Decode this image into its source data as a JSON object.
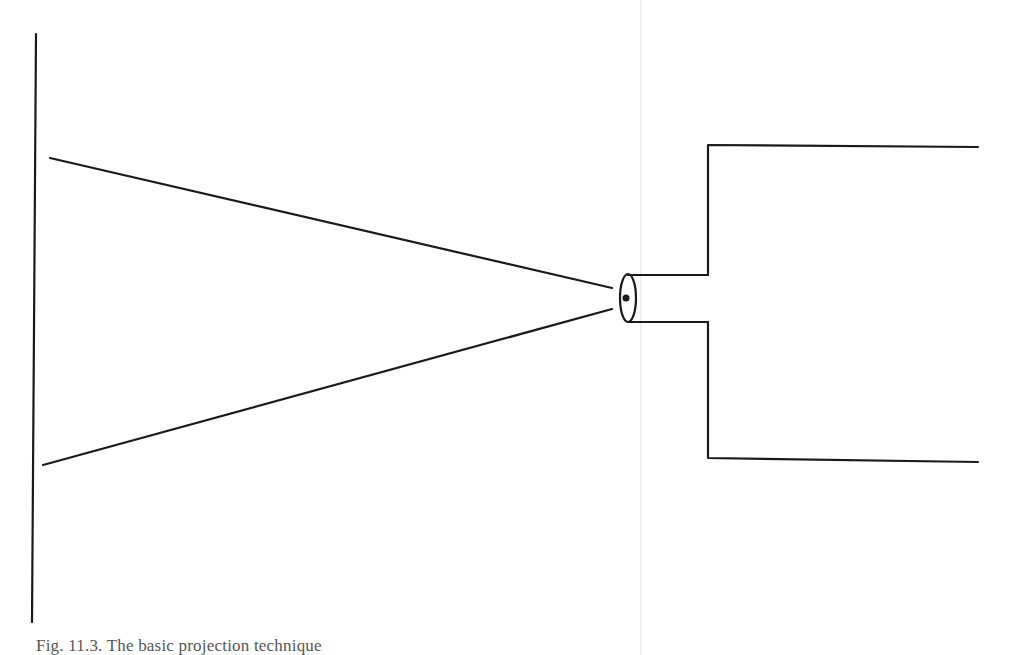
{
  "figure": {
    "caption": "Fig. 11.3. The basic projection technique",
    "stroke_color": "#1a1a1a",
    "background": "#ffffff",
    "elements": {
      "screen": {
        "x1": 36,
        "y1": 34,
        "x2": 32,
        "y2": 622
      },
      "beam_upper": {
        "x1": 50,
        "y1": 158,
        "x2": 612,
        "y2": 288
      },
      "beam_lower": {
        "x1": 43,
        "y1": 465,
        "x2": 612,
        "y2": 309
      },
      "lens": {
        "cx": 628,
        "cy": 298,
        "rx": 8,
        "ry": 24
      },
      "barrel_top_y": 274,
      "barrel_bottom_y": 322,
      "barrel_end_x": 708,
      "projector_body": {
        "x": 708,
        "top": 145,
        "bottom": 460,
        "right": 978
      }
    }
  }
}
